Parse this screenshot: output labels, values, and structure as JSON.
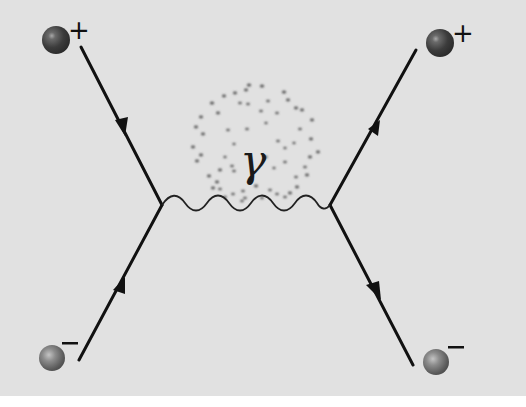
{
  "diagram": {
    "type": "feynman-diagram",
    "colors": {
      "background": "#e1e1e1",
      "line": "#111111",
      "sphere_dark": "#3a3a3a",
      "sphere_light": "#8a8a8a"
    },
    "particles": [
      {
        "id": "incoming-positron",
        "position": "top-left",
        "charge_label": "+",
        "arrow": "toward-vertex-reversed"
      },
      {
        "id": "incoming-electron",
        "position": "bottom-left",
        "charge_label": "−",
        "arrow": "toward-vertex"
      },
      {
        "id": "outgoing-positron",
        "position": "top-right",
        "charge_label": "+",
        "arrow": "away-from-vertex-reversed"
      },
      {
        "id": "outgoing-electron",
        "position": "bottom-right",
        "charge_label": "−",
        "arrow": "away-from-vertex"
      }
    ],
    "propagator": {
      "type": "photon",
      "symbol": "γ",
      "style": "wavy-line",
      "has_virtual-cloud": true
    }
  }
}
